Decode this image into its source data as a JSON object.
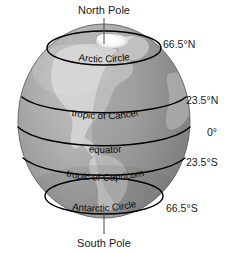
{
  "figure": {
    "type": "globe-latitude-diagram",
    "background_color": "#ffffff",
    "line_color": "#000000",
    "text_color": "#1b1b1b"
  },
  "poles": {
    "north": "North Pole",
    "south": "South Pole"
  },
  "latitude_labels": [
    {
      "text": "66.5°N",
      "x": 163,
      "y": 48
    },
    {
      "text": "23.5°N",
      "x": 186,
      "y": 104
    },
    {
      "text": "0°",
      "x": 207,
      "y": 136
    },
    {
      "text": "23.5°S",
      "x": 186,
      "y": 166
    },
    {
      "text": "66.5°S",
      "x": 166,
      "y": 212
    }
  ],
  "globe_lines": [
    {
      "name": "arctic-circle",
      "label": "Arctic Circle"
    },
    {
      "name": "tropic-of-cancer",
      "label": "tropic of Cancer"
    },
    {
      "name": "equator",
      "label": "equator"
    },
    {
      "name": "tropic-of-capricorn",
      "label": "tropic of Capricorn"
    },
    {
      "name": "antarctic-circle",
      "label": "Antarctic Circle"
    }
  ],
  "palette": {
    "ocean_light": "#b9b9b9",
    "ocean_dark": "#8e8e8e",
    "land": "#d2d2d2",
    "ice_cap": "#fdfdfd",
    "limb_shadow": "#7a7a7a"
  }
}
